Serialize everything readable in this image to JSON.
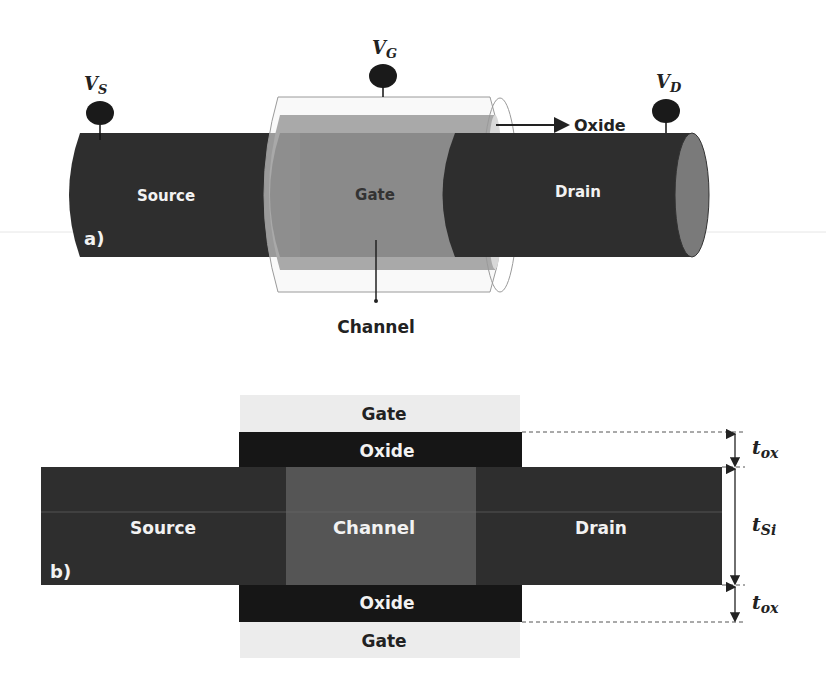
{
  "figure_a": {
    "panel_label": "a)",
    "regions": {
      "source": "Source",
      "gate": "Gate",
      "drain": "Drain"
    },
    "annotations": {
      "oxide": "Oxide",
      "channel": "Channel"
    },
    "terminals": {
      "source": {
        "name": "V",
        "sub": "S"
      },
      "gate": {
        "name": "V",
        "sub": "G"
      },
      "drain": {
        "name": "V",
        "sub": "D"
      }
    }
  },
  "figure_b": {
    "panel_label": "b)",
    "layers": {
      "gate_top": "Gate",
      "oxide_top": "Oxide",
      "source": "Source",
      "channel": "Channel",
      "drain": "Drain",
      "oxide_bottom": "Oxide",
      "gate_bottom": "Gate"
    },
    "dimensions": {
      "tox_top": {
        "name": "t",
        "sub": "ox"
      },
      "tsi": {
        "name": "t",
        "sub": "Si"
      },
      "tox_bottom": {
        "name": "t",
        "sub": "ox"
      }
    }
  },
  "colors": {
    "source_drain": "#2e2e2e",
    "gate_fill": "#8a8a8a",
    "gate_light": "#a9a9a9",
    "channel": "#555555",
    "oxide": "#161616",
    "gate_b": "#ececec",
    "terminal": "#1a1a1a",
    "drain_cap": "#7a7a7a"
  }
}
